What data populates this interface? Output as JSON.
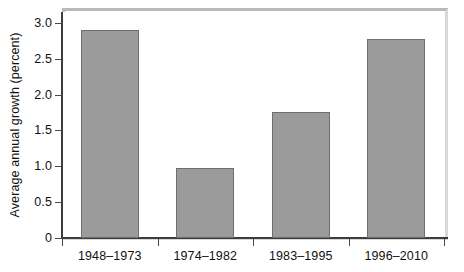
{
  "chart_data": {
    "type": "bar",
    "title": "",
    "xlabel": "",
    "ylabel": "Average annual growth (percent)",
    "categories": [
      "1948–1973",
      "1974–1982",
      "1983–1995",
      "1996–2010"
    ],
    "values": [
      2.9,
      0.98,
      1.75,
      2.78
    ],
    "ylim": [
      0,
      3.15
    ],
    "yticks": [
      0,
      0.5,
      1.0,
      1.5,
      2.0,
      2.5,
      3.0
    ],
    "ytick_labels": [
      "0",
      "0.5",
      "1.0",
      "1.5",
      "2.0",
      "2.5",
      "3.0"
    ],
    "grid": false,
    "legend": "none",
    "bar_color": "#9b9b9b",
    "bar_edge_color": "#6e6e6e",
    "axis_color": "#3d3d3d",
    "frame_color": "#d8d8d8"
  }
}
